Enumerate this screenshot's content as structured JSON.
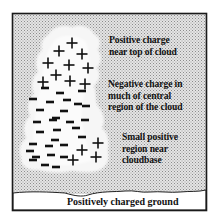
{
  "diagram": {
    "colors": {
      "sky_pattern_fg": "#9a9a9a",
      "sky_pattern_bg": "#e6e6e6",
      "cloud": "#f7f7f7",
      "frame": "#222222",
      "ground": "#ffffff",
      "charge": "#111111"
    },
    "labels": {
      "top_positive": [
        "Positive charge",
        "near top of cloud"
      ],
      "central_negative": [
        "Negative charge in",
        "much of central",
        "region of the cloud"
      ],
      "base_positive": [
        "Small positive",
        "region near",
        "cloudbase"
      ],
      "ground": "Positively charged ground"
    },
    "charges": {
      "upper_plus": [
        [
          72,
          43
        ],
        [
          59,
          51
        ],
        [
          82,
          54
        ],
        [
          48,
          63
        ],
        [
          69,
          65
        ],
        [
          88,
          68
        ],
        [
          56,
          75
        ],
        [
          43,
          82
        ],
        [
          70,
          81
        ],
        [
          85,
          84
        ]
      ],
      "minus": [
        [
          45,
          88
        ],
        [
          60,
          93
        ],
        [
          82,
          91
        ],
        [
          67,
          100
        ],
        [
          33,
          99
        ],
        [
          50,
          102
        ],
        [
          78,
          104
        ],
        [
          40,
          110
        ],
        [
          64,
          111
        ],
        [
          86,
          106
        ],
        [
          56,
          118
        ],
        [
          37,
          122
        ],
        [
          53,
          120
        ],
        [
          70,
          122
        ],
        [
          85,
          120
        ],
        [
          40,
          132
        ],
        [
          57,
          130
        ],
        [
          76,
          128
        ],
        [
          55,
          140
        ],
        [
          82,
          137
        ],
        [
          33,
          144
        ],
        [
          49,
          146
        ],
        [
          64,
          145
        ],
        [
          36,
          157
        ],
        [
          51,
          155
        ],
        [
          64,
          157
        ],
        [
          33,
          160
        ],
        [
          45,
          165
        ],
        [
          56,
          167
        ],
        [
          30,
          151
        ]
      ],
      "lower_plus": [
        [
          82,
          150
        ],
        [
          98,
          143
        ],
        [
          73,
          160
        ],
        [
          96,
          157
        ]
      ]
    }
  }
}
